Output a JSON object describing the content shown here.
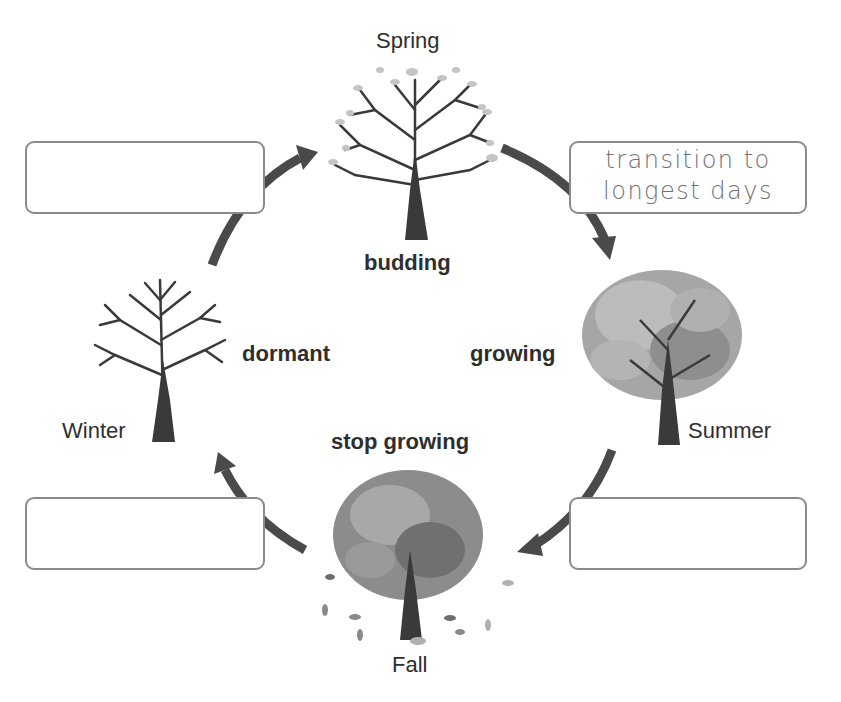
{
  "seasons": {
    "spring": "Spring",
    "summer": "Summer",
    "fall": "Fall",
    "winter": "Winter"
  },
  "stages": {
    "budding": "budding",
    "growing": "growing",
    "stop_growing": "stop growing",
    "dormant": "dormant"
  },
  "answer_boxes": {
    "spring_to_summer": {
      "value": "transition to longest days",
      "line1": "transition to",
      "line2": "longest days"
    },
    "summer_to_fall": {
      "value": ""
    },
    "fall_to_winter": {
      "value": ""
    },
    "winter_to_spring": {
      "value": ""
    }
  },
  "colors": {
    "arrow": "#4a4a4a",
    "trunk": "#3a3a3a",
    "box_border": "#8a8a8a",
    "leaf_light": "#c4c4c4",
    "leaf_mid": "#9a9a9a",
    "leaf_dark": "#6e6e6e"
  }
}
